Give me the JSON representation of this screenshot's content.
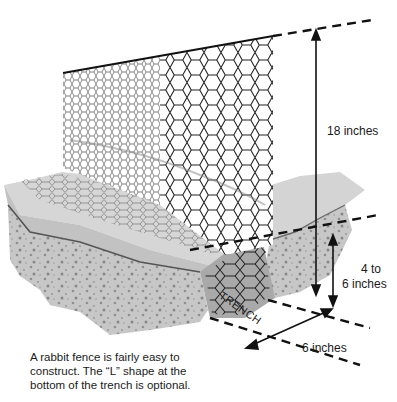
{
  "figure": {
    "colors": {
      "mesh": "#222222",
      "ground_top": "#d4d4d4",
      "ground_side": "#bdbdbd",
      "soil_speckle": "#8f8f8f",
      "dimension_line": "#111111",
      "background": "#ffffff"
    },
    "icons": [
      "hexagonal-wire-mesh",
      "dimension-arrow",
      "dashed-guide-line"
    ]
  },
  "dimensions": {
    "height_label": "18 inches",
    "depth_label_line1": "4 to",
    "depth_label_line2": "6 inches",
    "width_label": "6 inches"
  },
  "labels": {
    "trench": "TRENCH"
  },
  "caption": {
    "line1": "A rabbit fence is fairly easy to",
    "line2": "construct. The “L” shape at the",
    "line3": "bottom of the trench is optional."
  }
}
